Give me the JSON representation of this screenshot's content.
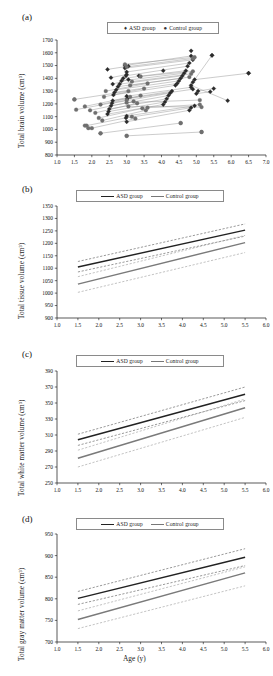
{
  "figure": {
    "caption_panels": [
      "(a)",
      "(b)",
      "(c)",
      "(d)"
    ],
    "xlabel": "Age (y)",
    "colors": {
      "asd_line": "#222222",
      "control_line": "#7a7a7a",
      "asd_ci": "#555555",
      "control_ci": "#9a9a9a",
      "axis": "#111111"
    }
  },
  "legend": {
    "scatter": {
      "asd_marker": "♦",
      "asd_label": "ASD group",
      "control_marker": "●",
      "control_label": "Control group"
    },
    "line": {
      "asd_label": "ASD group",
      "control_label": "Control group"
    }
  },
  "chart_data": [
    {
      "panel": "(a)",
      "type": "scatter",
      "title": "",
      "xlabel": "",
      "ylabel": "Total brain volume (cm³)",
      "xlim": [
        1.0,
        7.0
      ],
      "ylim": [
        800,
        1700
      ],
      "xticks": [
        "1.0",
        "1.5",
        "2.0",
        "2.5",
        "3.0",
        "3.5",
        "4.0",
        "4.5",
        "5.0",
        "5.5",
        "6.0",
        "6.5",
        "7.0"
      ],
      "yticks": [
        "800",
        "900",
        "1000",
        "1100",
        "1200",
        "1300",
        "1400",
        "1500",
        "1600",
        "1700"
      ],
      "grid": false,
      "legend_position": "top-center",
      "note": "Longitudinal paired observations; each subject's two scans joined by a straight line.",
      "series": [
        {
          "name": "ASD group",
          "marker": "diamond",
          "color": "#2b2b2b",
          "pairs": [
            [
              [
                2.45,
                1470
              ],
              [
                3.05,
                1495
              ]
            ],
            [
              [
                2.55,
                1405
              ],
              [
                3.0,
                1430
              ]
            ],
            [
              [
                2.6,
                1355
              ],
              [
                3.05,
                1390
              ]
            ],
            [
              [
                2.95,
                1500
              ],
              [
                4.85,
                1575
              ]
            ],
            [
              [
                2.95,
                1480
              ],
              [
                4.9,
                1545
              ]
            ],
            [
              [
                3.0,
                1450
              ],
              [
                4.8,
                1520
              ]
            ],
            [
              [
                2.98,
                1420
              ],
              [
                4.75,
                1495
              ]
            ],
            [
              [
                2.9,
                1400
              ],
              [
                4.7,
                1460
              ]
            ],
            [
              [
                2.85,
                1380
              ],
              [
                4.65,
                1440
              ]
            ],
            [
              [
                2.8,
                1355
              ],
              [
                4.6,
                1420
              ]
            ],
            [
              [
                2.75,
                1335
              ],
              [
                4.55,
                1400
              ]
            ],
            [
              [
                2.7,
                1310
              ],
              [
                4.5,
                1380
              ]
            ],
            [
              [
                2.65,
                1290
              ],
              [
                4.45,
                1360
              ]
            ],
            [
              [
                2.62,
                1270
              ],
              [
                4.4,
                1345
              ]
            ],
            [
              [
                3.0,
                1260
              ],
              [
                4.85,
                1330
              ]
            ],
            [
              [
                3.02,
                1240
              ],
              [
                4.9,
                1315
              ]
            ],
            [
              [
                2.6,
                1225
              ],
              [
                4.3,
                1300
              ]
            ],
            [
              [
                2.58,
                1205
              ],
              [
                4.25,
                1285
              ]
            ],
            [
              [
                2.55,
                1185
              ],
              [
                4.2,
                1265
              ]
            ],
            [
              [
                2.5,
                1160
              ],
              [
                4.15,
                1240
              ]
            ],
            [
              [
                2.48,
                1140
              ],
              [
                4.1,
                1215
              ]
            ],
            [
              [
                2.45,
                1120
              ],
              [
                4.05,
                1195
              ]
            ],
            [
              [
                3.0,
                1105
              ],
              [
                4.95,
                1185
              ]
            ],
            [
              [
                2.98,
                1090
              ],
              [
                4.85,
                1170
              ]
            ],
            [
              [
                3.0,
                1060
              ],
              [
                4.8,
                1150
              ]
            ],
            [
              [
                4.95,
                1390
              ],
              [
                6.5,
                1440
              ]
            ],
            [
              [
                4.9,
                1370
              ],
              [
                5.45,
                1580
              ]
            ],
            [
              [
                4.85,
                1345
              ],
              [
                5.9,
                1225
              ]
            ],
            [
              [
                5.05,
                1300
              ],
              [
                5.5,
                1320
              ]
            ],
            [
              [
                5.0,
                1280
              ],
              [
                5.4,
                1295
              ]
            ]
          ],
          "singles": [
            [
              4.85,
              1615
            ],
            [
              5.45,
              1580
            ],
            [
              6.5,
              1440
            ],
            [
              3.35,
              1420
            ],
            [
              4.05,
              1460
            ]
          ]
        },
        {
          "name": "Control group",
          "marker": "circle",
          "color": "#6f6f6f",
          "pairs": [
            [
              [
                1.5,
                1235
              ],
              [
                3.05,
                1300
              ]
            ],
            [
              [
                1.55,
                1155
              ],
              [
                3.0,
                1230
              ]
            ],
            [
              [
                1.8,
                1180
              ],
              [
                3.1,
                1255
              ]
            ],
            [
              [
                1.95,
                1150
              ],
              [
                3.2,
                1220
              ]
            ],
            [
              [
                2.1,
                1130
              ],
              [
                3.3,
                1205
              ]
            ],
            [
              [
                2.25,
                1195
              ],
              [
                3.4,
                1265
              ]
            ],
            [
              [
                2.35,
                1255
              ],
              [
                3.5,
                1320
              ]
            ],
            [
              [
                2.4,
                1300
              ],
              [
                3.6,
                1360
              ]
            ],
            [
              [
                2.2,
                1090
              ],
              [
                3.45,
                1165
              ]
            ],
            [
              [
                2.3,
                1070
              ],
              [
                3.55,
                1150
              ]
            ],
            [
              [
                2.25,
                970
              ],
              [
                4.55,
                1050
              ]
            ],
            [
              [
                3.0,
                950
              ],
              [
                5.15,
                980
              ]
            ],
            [
              [
                2.0,
                1010
              ],
              [
                3.25,
                1085
              ]
            ],
            [
              [
                1.85,
                1030
              ],
              [
                3.15,
                1100
              ]
            ],
            [
              [
                3.05,
                1180
              ],
              [
                5.15,
                1175
              ]
            ],
            [
              [
                3.0,
                1210
              ],
              [
                5.1,
                1230
              ]
            ],
            [
              [
                3.1,
                1345
              ],
              [
                4.8,
                1410
              ]
            ],
            [
              [
                3.15,
                1375
              ],
              [
                4.85,
                1435
              ]
            ],
            [
              [
                3.4,
                1415
              ],
              [
                4.9,
                1455
              ]
            ],
            [
              [
                3.6,
                1170
              ],
              [
                5.1,
                1195
              ]
            ],
            [
              [
                3.0,
                1490
              ],
              [
                4.9,
                1555
              ]
            ],
            [
              [
                2.95,
                1510
              ],
              [
                4.95,
                1565
              ]
            ]
          ],
          "singles": [
            [
              1.5,
              1235
            ],
            [
              1.8,
              1030
            ],
            [
              1.9,
              1010
            ],
            [
              2.25,
              970
            ],
            [
              3.0,
              950
            ],
            [
              5.15,
              980
            ],
            [
              4.55,
              1050
            ]
          ]
        }
      ]
    },
    {
      "panel": "(b)",
      "type": "line",
      "title": "",
      "xlabel": "",
      "ylabel": "Total tissue volume (cm³)",
      "xlim": [
        1.0,
        6.0
      ],
      "ylim": [
        900,
        1350
      ],
      "xticks": [
        "1.0",
        "1.5",
        "2.0",
        "2.5",
        "3.0",
        "3.5",
        "4.0",
        "4.5",
        "5.0",
        "5.5",
        "6.0"
      ],
      "yticks": [
        "900",
        "950",
        "1000",
        "1050",
        "1100",
        "1150",
        "1200",
        "1250",
        "1300",
        "1350"
      ],
      "grid": false,
      "legend_position": "top-center",
      "x_fit_range": [
        1.5,
        5.5
      ],
      "series": [
        {
          "name": "ASD group",
          "style": "solid",
          "color": "#222222",
          "y_at_x": [
            [
              1.5,
              1105
            ],
            [
              5.5,
              1253
            ]
          ]
        },
        {
          "name": "ASD group upper CI",
          "style": "dashed",
          "color": "#555555",
          "y_at_x": [
            [
              1.5,
              1127
            ],
            [
              5.5,
              1278
            ]
          ]
        },
        {
          "name": "ASD group lower CI",
          "style": "dashed",
          "color": "#555555",
          "y_at_x": [
            [
              1.5,
              1085
            ],
            [
              5.5,
              1229
            ]
          ]
        },
        {
          "name": "Control group",
          "style": "solid",
          "color": "#7a7a7a",
          "y_at_x": [
            [
              1.5,
              1036
            ],
            [
              5.5,
              1203
            ]
          ]
        },
        {
          "name": "Control group upper CI",
          "style": "dashed",
          "color": "#9a9a9a",
          "y_at_x": [
            [
              1.5,
              1066
            ],
            [
              5.5,
              1232
            ]
          ]
        },
        {
          "name": "Control group lower CI",
          "style": "dashed",
          "color": "#9a9a9a",
          "y_at_x": [
            [
              1.5,
              1003
            ],
            [
              5.5,
              1163
            ]
          ]
        }
      ]
    },
    {
      "panel": "(c)",
      "type": "line",
      "title": "",
      "xlabel": "",
      "ylabel": "Total white matter volume (cm³)",
      "xlim": [
        1.0,
        6.0
      ],
      "ylim": [
        250,
        390
      ],
      "xticks": [
        "1.0",
        "1.5",
        "2.0",
        "2.5",
        "3.0",
        "3.5",
        "4.0",
        "4.5",
        "5.0",
        "5.5",
        "6.0"
      ],
      "yticks": [
        "250",
        "270",
        "290",
        "310",
        "330",
        "350",
        "370",
        "390"
      ],
      "grid": false,
      "legend_position": "top-center",
      "x_fit_range": [
        1.5,
        5.5
      ],
      "series": [
        {
          "name": "ASD group",
          "style": "solid",
          "color": "#222222",
          "y_at_x": [
            [
              1.5,
              304
            ],
            [
              5.5,
              361
            ]
          ]
        },
        {
          "name": "ASD group upper CI",
          "style": "dashed",
          "color": "#555555",
          "y_at_x": [
            [
              1.5,
              311
            ],
            [
              5.5,
              370
            ]
          ]
        },
        {
          "name": "ASD group lower CI",
          "style": "dashed",
          "color": "#555555",
          "y_at_x": [
            [
              1.5,
              297
            ],
            [
              5.5,
              353
            ]
          ]
        },
        {
          "name": "Control group",
          "style": "solid",
          "color": "#7a7a7a",
          "y_at_x": [
            [
              1.5,
              281
            ],
            [
              5.5,
              344
            ]
          ]
        },
        {
          "name": "Control group upper CI",
          "style": "dashed",
          "color": "#9a9a9a",
          "y_at_x": [
            [
              1.5,
              291
            ],
            [
              5.5,
              355
            ]
          ]
        },
        {
          "name": "Control group lower CI",
          "style": "dashed",
          "color": "#9a9a9a",
          "y_at_x": [
            [
              1.5,
              270
            ],
            [
              5.5,
              332
            ]
          ]
        }
      ]
    },
    {
      "panel": "(d)",
      "type": "line",
      "title": "",
      "xlabel": "Age (y)",
      "ylabel": "Total gray matter volume (cm³)",
      "xlim": [
        1.0,
        6.0
      ],
      "ylim": [
        700,
        950
      ],
      "xticks": [
        "1.0",
        "1.5",
        "2.0",
        "2.5",
        "3.0",
        "3.5",
        "4.0",
        "4.5",
        "5.0",
        "5.5",
        "6.0"
      ],
      "yticks": [
        "700",
        "750",
        "800",
        "850",
        "900",
        "950"
      ],
      "grid": false,
      "legend_position": "top-center",
      "x_fit_range": [
        1.5,
        5.5
      ],
      "series": [
        {
          "name": "ASD group",
          "style": "solid",
          "color": "#222222",
          "y_at_x": [
            [
              1.5,
              801
            ],
            [
              5.5,
              896
            ]
          ]
        },
        {
          "name": "ASD group upper CI",
          "style": "dashed",
          "color": "#555555",
          "y_at_x": [
            [
              1.5,
              817
            ],
            [
              5.5,
              916
            ]
          ]
        },
        {
          "name": "ASD group lower CI",
          "style": "dashed",
          "color": "#555555",
          "y_at_x": [
            [
              1.5,
              787
            ],
            [
              5.5,
              877
            ]
          ]
        },
        {
          "name": "Control group",
          "style": "solid",
          "color": "#7a7a7a",
          "y_at_x": [
            [
              1.5,
              752
            ],
            [
              5.5,
              860
            ]
          ]
        },
        {
          "name": "Control group upper CI",
          "style": "dashed",
          "color": "#9a9a9a",
          "y_at_x": [
            [
              1.5,
              772
            ],
            [
              5.5,
              874
            ]
          ]
        },
        {
          "name": "Control group lower CI",
          "style": "dashed",
          "color": "#9a9a9a",
          "y_at_x": [
            [
              1.5,
              731
            ],
            [
              5.5,
              830
            ]
          ]
        }
      ]
    }
  ]
}
